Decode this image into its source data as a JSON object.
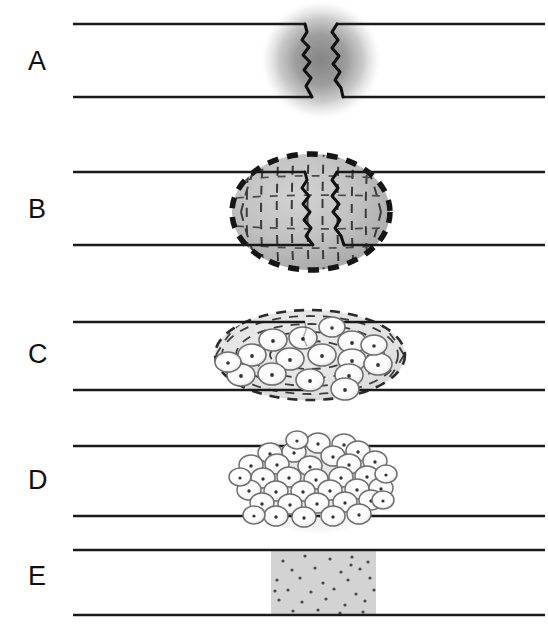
{
  "figure": {
    "type": "diagram",
    "panel_count": 5,
    "width": 548,
    "height": 628,
    "background_color": "#ffffff",
    "bone_line_color": "#1a1a1a",
    "callus_fill_color": "#bdbdbd",
    "cell_fill_color": "#fafafa",
    "cell_stroke_color": "#6e6e6e",
    "remodeled_fill_color": "#d3d3d3",
    "dash_color": "#3d3d3d"
  },
  "panels": [
    {
      "label": "A",
      "label_x": 28,
      "label_y": 48,
      "stage_name": "hematoma",
      "cortex_top_y": 24,
      "cortex_bottom_y": 97,
      "cortex_x_start": 73,
      "cortex_x_end": 545,
      "fracture_center_x": 320,
      "callus_shape": "blurred-circle",
      "callus_cx": 321,
      "callus_cy": 60,
      "callus_rx": 60,
      "callus_ry": 60,
      "has_dashed_border": false,
      "has_fibers": false,
      "cell_count": 0
    },
    {
      "label": "B",
      "label_x": 28,
      "label_y": 221,
      "stage_name": "fibrous-callus",
      "cortex_top_y": 172,
      "cortex_bottom_y": 245,
      "cortex_x_start": 73,
      "cortex_x_end": 545,
      "fracture_center_x": 320,
      "callus_shape": "dashed-ellipse-with-fibers",
      "callus_cx": 311,
      "callus_cy": 212,
      "callus_rx": 80,
      "callus_ry": 59,
      "has_dashed_border": true,
      "has_fibers": true,
      "cell_count": 0
    },
    {
      "label": "C",
      "label_x": 28,
      "label_y": 366,
      "stage_name": "cartilaginous-callus",
      "cortex_top_y": 322,
      "cortex_bottom_y": 390,
      "cortex_x_start": 73,
      "cortex_x_end": 545,
      "fracture_center_x": 320,
      "callus_shape": "dashed-ellipse-with-cells",
      "callus_cx": 310,
      "callus_cy": 355,
      "callus_rx": 96,
      "callus_ry": 46,
      "has_dashed_border": true,
      "has_fibers": true,
      "cell_count": 16
    },
    {
      "label": "D",
      "label_x": 28,
      "label_y": 492,
      "stage_name": "bony-callus",
      "cortex_top_y": 446,
      "cortex_bottom_y": 516,
      "cortex_x_start": 73,
      "cortex_x_end": 545,
      "fracture_center_x": 320,
      "callus_shape": "dense-cell-cluster",
      "callus_cx": 318,
      "callus_cy": 483,
      "callus_rx": 72,
      "callus_ry": 50,
      "has_dashed_border": false,
      "has_fibers": false,
      "cell_count": 36
    },
    {
      "label": "E",
      "label_x": 28,
      "label_y": 588,
      "stage_name": "remodeled-bone",
      "cortex_top_y": 550,
      "cortex_bottom_y": 615,
      "cortex_x_start": 73,
      "cortex_x_end": 545,
      "fracture_center_x": 320,
      "callus_shape": "speckled-rectangle",
      "rect_x": 271,
      "rect_y": 550,
      "rect_width": 105,
      "rect_height": 65,
      "has_dashed_border": false,
      "has_fibers": false,
      "cell_count": 30
    }
  ],
  "fracture_line_left": "jagged vertical crack, left fragment edge",
  "fracture_line_right": "jagged vertical crack, right fragment edge"
}
